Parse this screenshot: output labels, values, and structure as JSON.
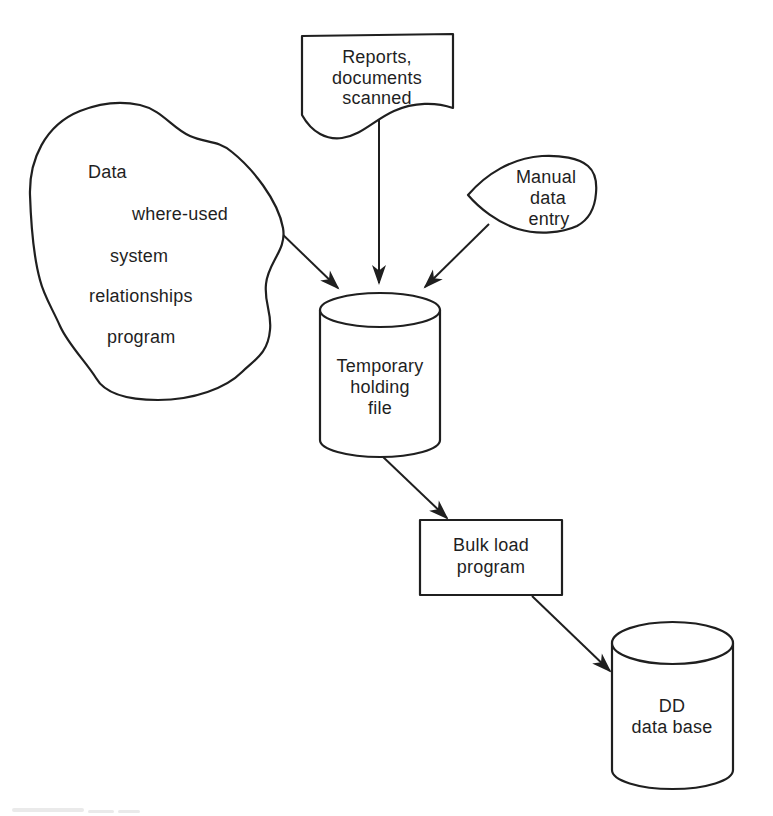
{
  "diagram": {
    "colors": {
      "ink": "#1f1f1f",
      "paper": "#ffffff"
    },
    "nodes": {
      "data_cloud": {
        "shape": "cloud",
        "lines": [
          "Data",
          "where-used",
          "system",
          "relationships",
          "program"
        ]
      },
      "reports_document": {
        "shape": "document",
        "lines": [
          "Reports,",
          "documents",
          "scanned"
        ]
      },
      "manual_entry": {
        "shape": "manual-input",
        "lines": [
          "Manual",
          "data",
          "entry"
        ]
      },
      "temporary_holding_file": {
        "shape": "cylinder",
        "lines": [
          "Temporary",
          "holding",
          "file"
        ]
      },
      "bulk_load_program": {
        "shape": "rectangle",
        "lines": [
          "Bulk load",
          "program"
        ]
      },
      "dd_data_base": {
        "shape": "cylinder",
        "lines": [
          "DD",
          "data base"
        ]
      }
    },
    "edges": [
      {
        "from": "data_cloud",
        "to": "temporary_holding_file"
      },
      {
        "from": "reports_document",
        "to": "temporary_holding_file"
      },
      {
        "from": "manual_entry",
        "to": "temporary_holding_file"
      },
      {
        "from": "temporary_holding_file",
        "to": "bulk_load_program"
      },
      {
        "from": "bulk_load_program",
        "to": "dd_data_base"
      }
    ]
  }
}
